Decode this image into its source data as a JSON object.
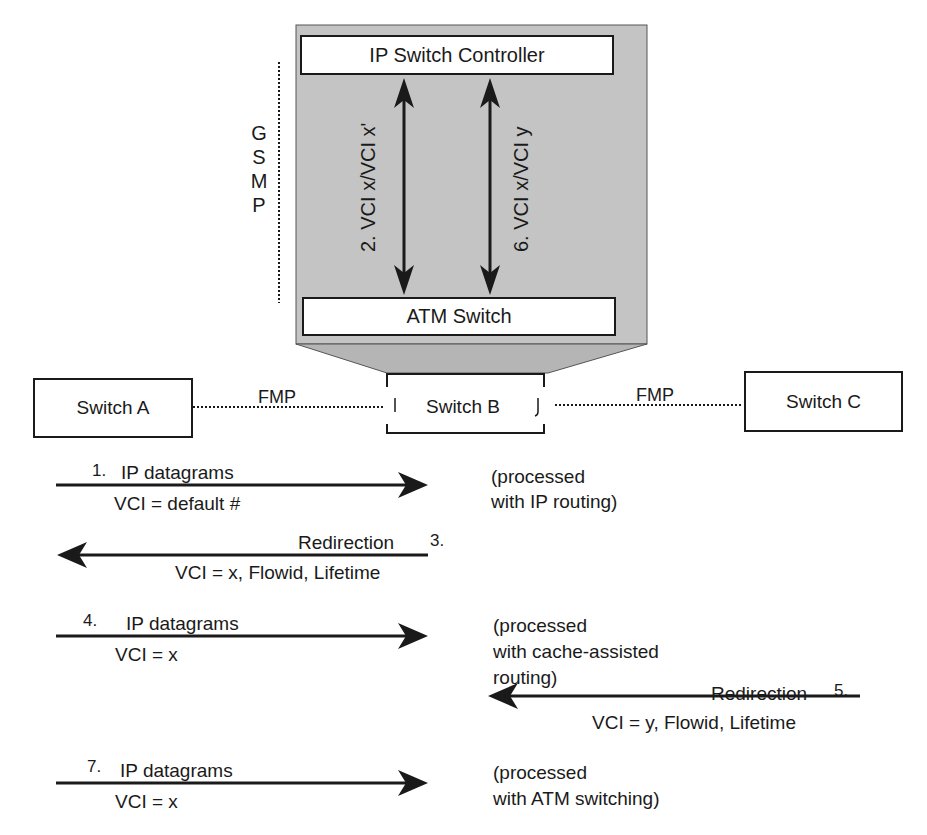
{
  "diagram": {
    "controller": {
      "controller_label": "IP Switch Controller",
      "atm_label": "ATM Switch",
      "arrow_left_label": "2.  VCI x/VCI x'",
      "arrow_right_label": "6.  VCI x/VCI y"
    },
    "gsmp_letters": [
      "G",
      "S",
      "M",
      "P"
    ],
    "switches": {
      "a": "Switch A",
      "b": "Switch B",
      "c": "Switch C"
    },
    "links": {
      "left": "FMP",
      "right": "FMP"
    },
    "steps": [
      {
        "num": "1.",
        "top": "IP datagrams",
        "bottom": "VCI = default #",
        "direction": "right",
        "note": [
          "(processed",
          "with IP routing)"
        ]
      },
      {
        "num": "3.",
        "top": "Redirection",
        "bottom": "VCI = x, Flowid, Lifetime",
        "direction": "left"
      },
      {
        "num": "4.",
        "top": "IP datagrams",
        "bottom": "VCI = x",
        "direction": "right",
        "note": [
          "(processed",
          "with cache-assisted",
          "routing)"
        ]
      },
      {
        "num": "5.",
        "top": "Redirection",
        "bottom": "VCI = y, Flowid, Lifetime",
        "direction": "left"
      },
      {
        "num": "7.",
        "top": "IP datagrams",
        "bottom": "VCI = x",
        "direction": "right",
        "note": [
          "(processed",
          "with ATM switching)"
        ]
      }
    ],
    "colors": {
      "panel_gray": "#c4c4c4",
      "funnel_gray": "#b5b5b5",
      "ink": "#1a1a1a"
    }
  }
}
